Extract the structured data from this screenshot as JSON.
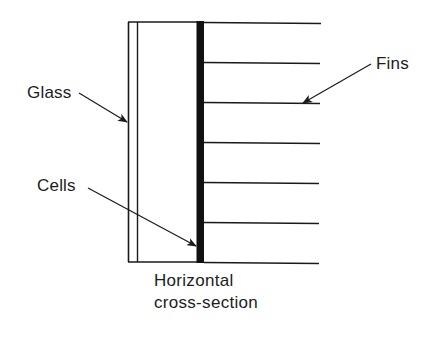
{
  "diagram": {
    "type": "technical-cross-section",
    "labels": {
      "glass": "Glass",
      "cells": "Cells",
      "fins": "Fins"
    },
    "caption": {
      "line1": "Horizontal",
      "line2": "cross-section"
    },
    "components": [
      {
        "name": "glass",
        "description": "thin double-walled front layer"
      },
      {
        "name": "cells",
        "description": "thick black vertical bar"
      },
      {
        "name": "fins",
        "description": "horizontal lines extending right",
        "count": 7
      }
    ],
    "colors": {
      "stroke": "#1a1a1a",
      "background": "#ffffff"
    }
  }
}
